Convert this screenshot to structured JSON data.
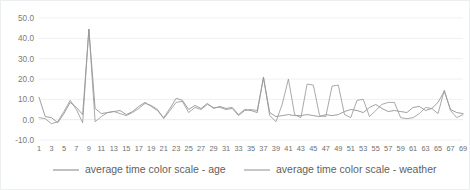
{
  "chart_data": {
    "type": "line",
    "title": "",
    "xlabel": "",
    "ylabel": "",
    "ylim": [
      -10.0,
      50.0
    ],
    "ytick_values": [
      -10.0,
      0.0,
      10.0,
      20.0,
      30.0,
      40.0,
      50.0
    ],
    "ytick_labels": [
      "-10.0",
      "0.0",
      "10.0",
      "20.0",
      "30.0",
      "40.0",
      "50.0"
    ],
    "grid": true,
    "legend_position": "bottom",
    "x": [
      1,
      2,
      3,
      4,
      5,
      6,
      7,
      8,
      9,
      10,
      11,
      12,
      13,
      14,
      15,
      16,
      17,
      18,
      19,
      20,
      21,
      22,
      23,
      24,
      25,
      26,
      27,
      28,
      29,
      30,
      31,
      32,
      33,
      34,
      35,
      36,
      37,
      38,
      39,
      40,
      41,
      42,
      43,
      44,
      45,
      46,
      47,
      48,
      49,
      50,
      51,
      52,
      53,
      54,
      55,
      56,
      57,
      58,
      59,
      60,
      61,
      62,
      63,
      64,
      65,
      66,
      67,
      68,
      69
    ],
    "xtick_labels": [
      "1",
      "3",
      "5",
      "7",
      "9",
      "11",
      "13",
      "15",
      "17",
      "19",
      "21",
      "23",
      "25",
      "27",
      "29",
      "31",
      "33",
      "35",
      "37",
      "39",
      "41",
      "43",
      "45",
      "47",
      "49",
      "51",
      "53",
      "55",
      "57",
      "59",
      "61",
      "63",
      "65",
      "67",
      "69"
    ],
    "series": [
      {
        "name": "average time color scale - age",
        "color": "#8e8e8e",
        "values": [
          11.0,
          1.5,
          1.0,
          -1.5,
          3.0,
          8.5,
          6.0,
          2.5,
          44.5,
          5.5,
          3.0,
          3.5,
          4.0,
          4.5,
          2.5,
          4.0,
          6.5,
          8.5,
          6.5,
          4.5,
          1.0,
          5.5,
          10.5,
          9.5,
          5.0,
          7.0,
          5.5,
          8.0,
          5.5,
          6.5,
          5.5,
          6.0,
          2.5,
          5.0,
          4.5,
          3.5,
          21.0,
          3.5,
          1.5,
          2.0,
          2.5,
          2.0,
          2.0,
          2.5,
          2.0,
          1.5,
          2.5,
          2.0,
          2.5,
          4.0,
          5.0,
          4.5,
          3.5,
          6.0,
          7.5,
          5.5,
          4.0,
          4.5,
          4.0,
          3.5,
          6.0,
          6.5,
          4.5,
          5.5,
          8.5,
          14.0,
          5.0,
          3.5,
          3.0
        ]
      },
      {
        "name": "average time color scale - weather",
        "color": "#9a9a9a",
        "values": [
          1.0,
          0.5,
          -2.0,
          -1.0,
          4.0,
          9.5,
          5.0,
          -1.5,
          44.5,
          -1.0,
          1.5,
          3.5,
          4.0,
          3.0,
          2.0,
          3.5,
          5.5,
          8.0,
          7.0,
          5.0,
          0.5,
          4.5,
          8.5,
          9.0,
          3.5,
          6.0,
          5.0,
          7.5,
          6.0,
          6.0,
          5.0,
          5.5,
          2.0,
          4.5,
          5.0,
          4.5,
          20.5,
          2.0,
          -1.0,
          7.5,
          20.0,
          2.5,
          1.0,
          17.5,
          17.0,
          2.0,
          1.5,
          16.5,
          17.0,
          2.5,
          1.0,
          9.5,
          10.0,
          1.5,
          4.5,
          7.5,
          8.5,
          8.5,
          1.0,
          0.5,
          1.0,
          3.0,
          6.0,
          5.5,
          3.0,
          14.5,
          4.5,
          1.0,
          2.5
        ]
      }
    ]
  },
  "legend": {
    "entries": [
      {
        "label": "average time color scale - age"
      },
      {
        "label": "average time color scale - weather"
      }
    ]
  }
}
